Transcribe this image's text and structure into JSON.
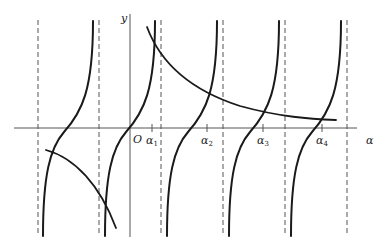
{
  "diagram": {
    "title": "",
    "axis_labels": {
      "x": "α",
      "y": "y",
      "origin": "O"
    },
    "ticks": [
      {
        "base": "α",
        "sub": "1"
      },
      {
        "base": "α",
        "sub": "2"
      },
      {
        "base": "α",
        "sub": "3"
      },
      {
        "base": "α",
        "sub": "4"
      }
    ],
    "colors": {
      "curve": "#1a1a1a",
      "axis": "#555555",
      "asymptote": "#555555",
      "background": "#ffffff"
    }
  }
}
